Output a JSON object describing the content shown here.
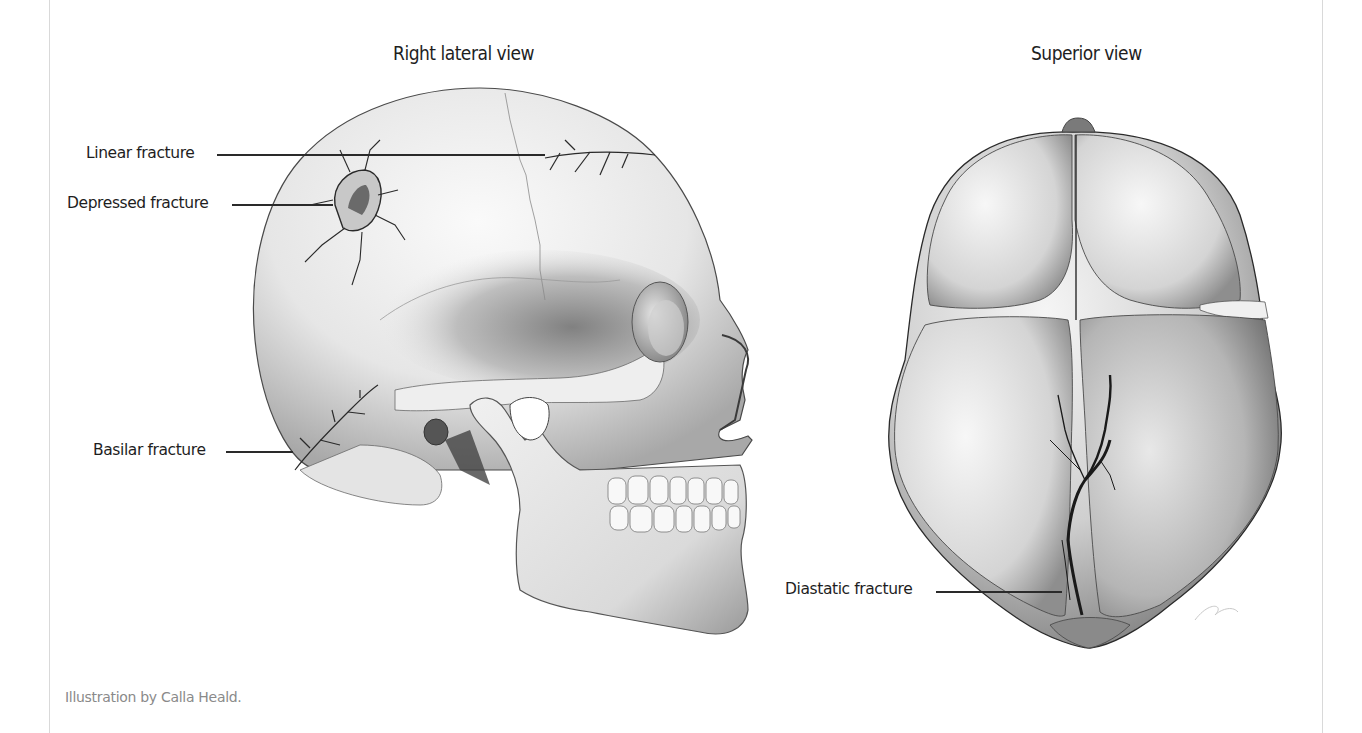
{
  "figure": {
    "views": [
      {
        "id": "lateral",
        "title": "Right lateral view"
      },
      {
        "id": "superior",
        "title": "Superior view"
      }
    ],
    "labels": {
      "linear": "Linear fracture",
      "depressed": "Depressed fracture",
      "basilar": "Basilar fracture",
      "diastatic": "Diastatic fracture"
    },
    "caption": "Illustration by Calla Heald.",
    "colors": {
      "background": "#ffffff",
      "text": "#1e1e1e",
      "caption_text": "#8a8a8a",
      "frame_line": "#d9d9d9",
      "bone_light": "#f2f2f2",
      "bone_shadow": "#7a7a7a",
      "fracture_line": "#1a1a1a"
    }
  }
}
